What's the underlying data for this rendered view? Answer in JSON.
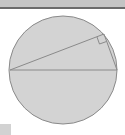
{
  "diagram": {
    "type": "geometry",
    "circle": {
      "cx": 63,
      "cy": 70,
      "r": 54,
      "fill": "#d3d3d3",
      "stroke": "#8a8a8a"
    },
    "diameter": {
      "x1": 10,
      "y1": 70,
      "x2": 117,
      "y2": 70
    },
    "vertex": {
      "x": 104,
      "y": 34
    },
    "right_angle_marker": true,
    "colors": {
      "line": "#8a8a8a",
      "fill": "#d3d3d3",
      "topbar": "#c4c4c4",
      "topbar_border": "#6a6a6a"
    }
  }
}
